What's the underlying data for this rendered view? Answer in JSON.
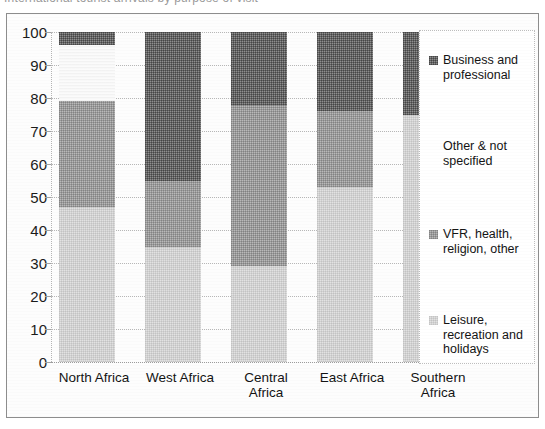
{
  "title": {
    "text": "International tourist arrivals by purpose of visit"
  },
  "chart_data": {
    "type": "bar",
    "stacked": true,
    "stack_mode": "percent",
    "title": "International tourist arrivals by purpose of visit",
    "xlabel": "",
    "ylabel": "",
    "ylim": [
      0,
      100
    ],
    "yticks": [
      0,
      10,
      20,
      30,
      40,
      50,
      60,
      70,
      80,
      90,
      100
    ],
    "ytick_labels": [
      "0",
      "10",
      "20",
      "30",
      "40",
      "50",
      "60",
      "70",
      "80",
      "90",
      "100"
    ],
    "grid": true,
    "legend_position": "right",
    "categories": [
      "North Africa",
      "West Africa",
      "Central Africa",
      "East Africa",
      "Southern Africa"
    ],
    "series": [
      {
        "name": "Leisure, recreation and holidays",
        "color": "#e2e2e2",
        "values": [
          47,
          35,
          29,
          53,
          75
        ]
      },
      {
        "name": "VFR, health, religion, other",
        "color": "#b9b9b9",
        "values": [
          32,
          20,
          49,
          23,
          0
        ]
      },
      {
        "name": "Other & not specified",
        "color": "#fbfbfb",
        "values": [
          17,
          0,
          0,
          0,
          0
        ]
      },
      {
        "name": "Business and professional",
        "color": "#8f8f8f",
        "values": [
          4,
          45,
          22,
          24,
          25
        ]
      }
    ]
  },
  "legend": {
    "items": [
      {
        "label": "Business and\nprofessional",
        "swatch": "business-swatch",
        "show_swatch": true
      },
      {
        "label": "Other & not\nspecified",
        "swatch": "other-swatch",
        "show_swatch": false
      },
      {
        "label": "VFR, health,\nreligion, other",
        "swatch": "vfr-swatch",
        "show_swatch": true
      },
      {
        "label": "Leisure,\nrecreation and\nholidays",
        "swatch": "leisure-swatch",
        "show_swatch": true
      }
    ]
  },
  "x_axis": {
    "labels": [
      "North Africa",
      "West Africa",
      "Central\nAfrica",
      "East Africa",
      "Southern\nAfrica"
    ]
  }
}
